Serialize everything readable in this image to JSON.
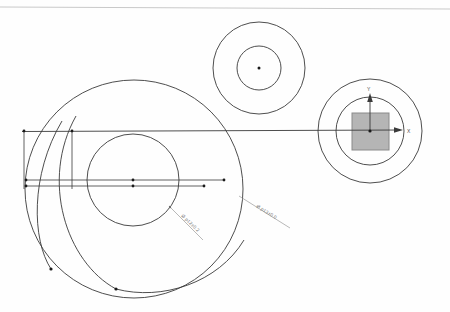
{
  "drawing": {
    "title": "CAD Technical Drawing",
    "background_color": "#fefefe",
    "line_color": "#3a3a3a",
    "faint_line_color": "#b8b8b8",
    "dim_text_color": "#7c7c7c",
    "square_fill_color": "#b5b5b5",
    "square_stroke_color": "#8a8a8a",
    "vertex_color": "#1a1a1a"
  },
  "border": {
    "top_rule_label": "sheet-top-rule"
  },
  "views": {
    "left_view": {
      "name": "large-circle-view",
      "outer_circle": {
        "cx": 134,
        "cy": 189,
        "r": 109
      },
      "inner_circle": {
        "cx": 133,
        "cy": 180,
        "r": 46
      },
      "center_marks": [
        {
          "cx": 133,
          "cy": 180
        },
        {
          "cx": 133,
          "cy": 185
        }
      ]
    },
    "top_view": {
      "name": "small-concentric-view",
      "outer_circle": {
        "cx": 259,
        "cy": 68
      },
      "inner_circle": {
        "cx": 259,
        "cy": 68
      },
      "outer_r": 46,
      "inner_r": 22,
      "center_point": {
        "cx": 259,
        "cy": 68
      }
    },
    "right_view": {
      "name": "coordinate-detail-view",
      "outer_circle": {
        "cx": 370,
        "cy": 131,
        "r": 52
      },
      "inner_circle": {
        "cx": 370,
        "cy": 131,
        "r": 34
      },
      "square": {
        "x": 352,
        "y": 113,
        "w": 37,
        "h": 37
      },
      "origin": {
        "cx": 370,
        "cy": 131
      }
    }
  },
  "axes": {
    "x_label": "X",
    "y_label": "Y",
    "x_label_pos": {
      "x": 409,
      "y": 133
    },
    "y_label_pos": {
      "x": 368,
      "y": 92
    }
  },
  "dimensions": [
    {
      "id": "dim-inner-diameter",
      "text": "Ø p12±0.2",
      "leader_from": {
        "x": 170,
        "y": 207
      },
      "leader_to": {
        "x": 184,
        "y": 222
      },
      "text_pos": {
        "x": 186,
        "y": 226
      },
      "rotation": 42
    },
    {
      "id": "dim-outer-diameter",
      "text": "Ø p13±0.0",
      "leader_from": {
        "x": 243,
        "y": 198
      },
      "leader_to": {
        "x": 262,
        "y": 216
      },
      "text_pos": {
        "x": 260,
        "y": 220
      },
      "rotation": 32
    }
  ],
  "construction_lines": {
    "primary_axis": {
      "name": "main-horizontal-axis",
      "x1": 22,
      "y1": 131,
      "x2": 404,
      "y2": 130,
      "has_arrow": true
    },
    "secondary_lines": [
      {
        "name": "center-line-upper",
        "x1": 26,
        "y1": 180,
        "x2": 224,
        "y2": 180
      },
      {
        "name": "center-line-lower",
        "x1": 26,
        "y1": 186,
        "x2": 204,
        "y2": 186
      }
    ],
    "vertical_ties": [
      {
        "name": "vertical-tie-left",
        "x1": 24,
        "y1": 131,
        "x2": 24,
        "y2": 189
      },
      {
        "name": "vertical-tie-mid",
        "x1": 72,
        "y1": 131,
        "x2": 72,
        "y2": 189
      }
    ],
    "endpoint_dots": [
      {
        "cx": 24,
        "cy": 131
      },
      {
        "cx": 72,
        "cy": 131
      },
      {
        "cx": 26,
        "cy": 180
      },
      {
        "cx": 26,
        "cy": 186
      },
      {
        "cx": 224,
        "cy": 180
      },
      {
        "cx": 204,
        "cy": 186
      },
      {
        "cx": 51,
        "cy": 269
      },
      {
        "cx": 116,
        "cy": 289
      }
    ]
  },
  "arcs": [
    {
      "name": "sweep-arc-outer",
      "d": "M 62 121 C 30 175 32 240 51 269"
    },
    {
      "name": "sweep-arc-inner",
      "d": "M 76 116 C 40 180 66 262 116 289"
    },
    {
      "name": "sweep-arc-tail",
      "d": "M 116 289 C 160 300 215 284 243 242"
    }
  ]
}
